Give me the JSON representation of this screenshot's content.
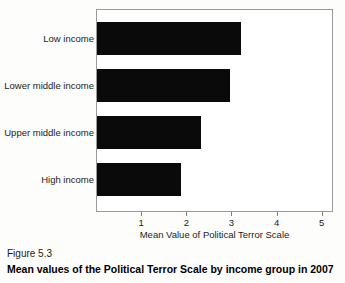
{
  "chart_data": {
    "type": "bar",
    "orientation": "horizontal",
    "title": "",
    "xlabel": "Mean Value of Political Terror Scale",
    "ylabel": "",
    "categories": [
      "Low income",
      "Lower middle income",
      "Upper middle income",
      "High income"
    ],
    "values": [
      3.2,
      2.95,
      2.3,
      1.85
    ],
    "series": [
      {
        "name": "Mean Value of Political Terror Scale",
        "values": [
          3.2,
          2.95,
          2.3,
          1.85
        ]
      }
    ],
    "xlim": [
      0,
      5.25
    ],
    "xticks": [
      1,
      2,
      3,
      4,
      5
    ],
    "xtick_labels": [
      "1",
      "2",
      "3",
      "4",
      "5"
    ],
    "grid": false,
    "legend": false,
    "legend_position": "none",
    "bar_color": "#0a0a0a",
    "plot_background": "#ffffff",
    "frame_color": "#9a9a98"
  },
  "caption": {
    "figure_number": "Figure 5.3",
    "figure_title": "Mean values of the Political Terror Scale by income group in 2007"
  }
}
